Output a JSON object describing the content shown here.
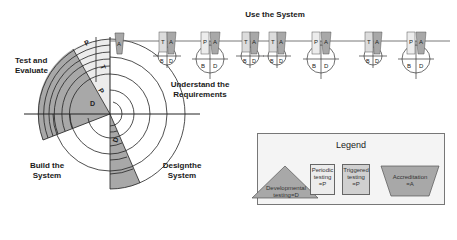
{
  "diagram": {
    "type": "spiral-lifecycle",
    "phases": [
      {
        "id": "use",
        "label": "Use the System"
      },
      {
        "id": "test",
        "label": "Test and\nEvaluate",
        "line1": "Test and",
        "line2": "Evaluate"
      },
      {
        "id": "understand",
        "label": "Understand the\nRequirements",
        "line1": "Understand the",
        "line2": "Requirements"
      },
      {
        "id": "build",
        "label": "Build the\nSystem",
        "line1": "Build the",
        "line2": "System"
      },
      {
        "id": "design",
        "label": "Designthe\nSystem",
        "line1": "Designthe",
        "line2": "System"
      }
    ],
    "sector_labels": {
      "test_outer": "P",
      "test_mid": "T",
      "test_inner": "P",
      "dev": "D",
      "design": "D"
    },
    "timeline": {
      "start_marker": "A",
      "milestones": [
        {
          "left": "T",
          "right": "A",
          "bottom_left": "B",
          "bottom_right": "D",
          "size": "small"
        },
        {
          "left": "P",
          "right": "A",
          "bottom_left": "B",
          "bottom_right": "D",
          "size": "large"
        },
        {
          "left": "T",
          "right": "A",
          "bottom_left": "B",
          "bottom_right": "D",
          "size": "small"
        },
        {
          "left": "T",
          "right": "A",
          "bottom_left": "B",
          "bottom_right": "D",
          "size": "small"
        },
        {
          "left": "P",
          "right": "A",
          "bottom_left": "B",
          "bottom_right": "D",
          "size": "large"
        },
        {
          "left": "T",
          "right": "A",
          "bottom_left": "B",
          "bottom_right": "D",
          "size": "small"
        },
        {
          "left": "P",
          "right": "A",
          "bottom_left": "B",
          "bottom_right": "D",
          "size": "large"
        }
      ]
    }
  },
  "legend": {
    "title": "Legend",
    "items": [
      {
        "shape": "triangle",
        "line1": "Developmental",
        "line2": "testing=D"
      },
      {
        "shape": "box-light",
        "line1": "Periodic",
        "line2": "testing",
        "line3": "=P"
      },
      {
        "shape": "box-mid",
        "line1": "Triggered",
        "line2": "testing",
        "line3": "=P"
      },
      {
        "shape": "trapezoid",
        "line1": "Accreditation",
        "line2": "=A"
      }
    ]
  },
  "colors": {
    "dark_fill": "#a8a8a8",
    "light_fill": "#ececec",
    "mid_fill": "#d0d0d0",
    "line": "#222222",
    "legend_bg": "#f4f4f4"
  }
}
